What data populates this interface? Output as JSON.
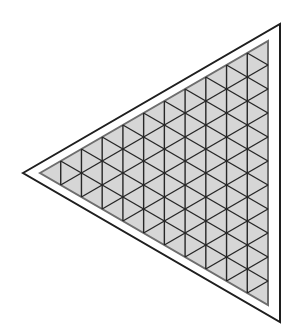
{
  "diagram": {
    "colors": {
      "background": "#ffffff",
      "outer_stroke": "#1e1e1e",
      "inner_fill": "#d6d6d6",
      "inner_border": "#6e6e6e",
      "grid_stroke": "#262626"
    },
    "outer_triangle": {
      "left": [
        23,
        173
      ],
      "top": [
        280,
        24
      ],
      "bottom": [
        280,
        322
      ]
    },
    "inner_triangle": {
      "left": [
        40,
        173
      ],
      "top": [
        268,
        41
      ],
      "bottom": [
        268,
        305
      ]
    },
    "subdivisions": 11
  }
}
